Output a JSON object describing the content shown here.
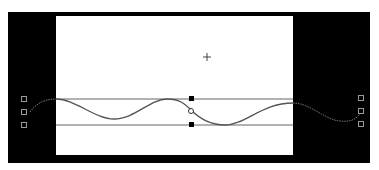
{
  "canvas": {
    "frame_color": "#000000",
    "stage_color": "#ffffff",
    "guide_color": "#555555",
    "curve_color": "#555555",
    "offstage_curve_color": "#666666"
  },
  "icons": {
    "crosshair": "crosshair-icon",
    "anchor": "anchor-handle",
    "node": "node-square-icon",
    "pivot": "pivot-circle-icon"
  }
}
